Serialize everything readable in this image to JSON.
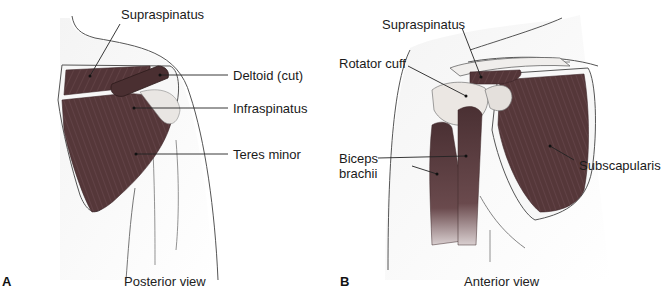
{
  "figure": {
    "panels": [
      {
        "letter": "A",
        "caption": "Posterior view",
        "labels": {
          "supraspinatus": "Supraspinatus",
          "deltoid": "Deltoid (cut)",
          "infraspinatus": "Infraspinatus",
          "teres_minor": "Teres minor"
        }
      },
      {
        "letter": "B",
        "caption": "Anterior view",
        "labels": {
          "supraspinatus": "Supraspinatus",
          "rotator_cuff": "Rotator cuff",
          "biceps_line1": "Biceps",
          "biceps_line2": "brachii",
          "subscapularis": "Subscapularis"
        }
      }
    ],
    "colors": {
      "muscle": "#5a3a3c",
      "muscle_dark": "#3e2527",
      "outline": "#444444",
      "tendon": "#e8e4e0"
    }
  }
}
